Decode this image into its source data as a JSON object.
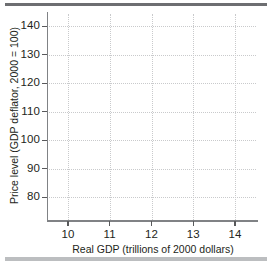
{
  "chart_data": {
    "type": "scatter",
    "title": "",
    "subtitle": "",
    "xlabel": "Real GDP (trillions of 2000 dollars)",
    "ylabel": "Price level (GDP deflator, 2000 = 100)",
    "xlim": [
      9.5,
      14.5
    ],
    "ylim": [
      72,
      145
    ],
    "xticks": [
      10,
      11,
      12,
      13,
      14
    ],
    "xticklabels": [
      "10",
      "11",
      "12",
      "13",
      "14"
    ],
    "yticks": [
      80,
      90,
      100,
      110,
      120,
      130,
      140
    ],
    "yticklabels": [
      "80",
      "90",
      "100",
      "110",
      "120",
      "130",
      "140"
    ],
    "grid": true,
    "grid_style": "dotted",
    "legend": "none",
    "series": [],
    "values": [],
    "annotations": [],
    "note": "Empty plotting grid; no data series are drawn in the figure."
  },
  "figure": {
    "background_color": "#ffffff",
    "axis_color": "#808285",
    "grid_color": "#c9cacc",
    "text_color": "#231f20",
    "rule_top_color": "#6d6e71",
    "rule_bottom_color": "#bcbec0"
  }
}
